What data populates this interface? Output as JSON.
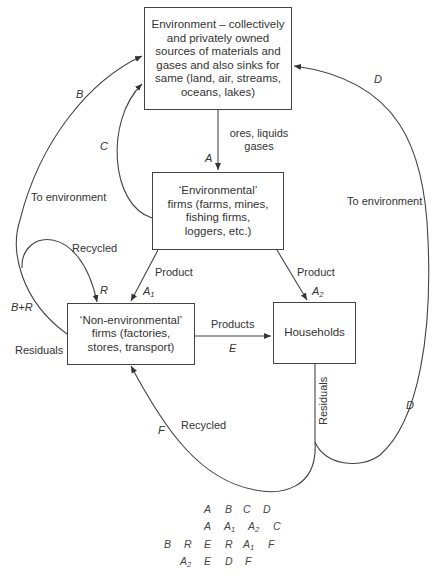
{
  "diagram": {
    "nodes": {
      "environment": "Environment – collectively and privately owned sources of materials and gases and also sinks for same (land, air, streams, oceans, lakes)",
      "env_firms": "‘Environmental’ firms (farms, mines, fishing firms, loggers, etc.)",
      "non_env_firms": "‘Non-environmental’ firms (factories, stores, transport)",
      "households": "Households"
    },
    "edge_labels": {
      "ores": "ores, liquids gases",
      "A": "A",
      "B": "B",
      "C": "C",
      "D_top": "D",
      "D_bottom": "D",
      "to_env_left": "To environment",
      "to_env_right": "To environment",
      "recycled_top": "Recycled",
      "R": "R",
      "BplusR": "B+R",
      "residuals_left": "Residuals",
      "product_left": "Product",
      "A1": "A",
      "A1_sub": "1",
      "product_right": "Product",
      "A2": "A",
      "A2_sub": "2",
      "products": "Products",
      "E": "E",
      "residuals_vertical": "Residuals",
      "recycled_bottom": "Recycled",
      "F": "F"
    },
    "balance_table": {
      "row1": [
        "A",
        "B",
        "C",
        "D"
      ],
      "row2": [
        "A",
        "A1",
        "A2",
        "C"
      ],
      "row3": [
        "B",
        "R",
        "E",
        "R",
        "A1",
        "F"
      ],
      "row4": [
        "A2",
        "E",
        "D",
        "F"
      ]
    }
  }
}
